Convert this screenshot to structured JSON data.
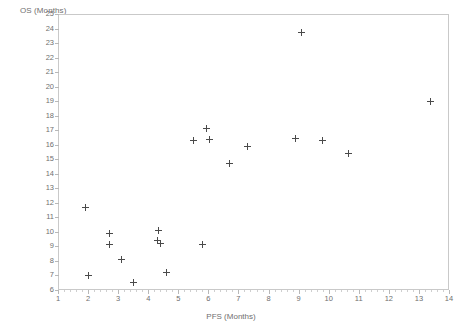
{
  "chart_data": {
    "type": "scatter",
    "title": "",
    "xlabel": "PFS (Months)",
    "ylabel": "OS (Months)",
    "xlim": [
      1,
      14
    ],
    "ylim": [
      6,
      25
    ],
    "xticks": [
      1,
      2,
      3,
      4,
      5,
      6,
      7,
      8,
      9,
      10,
      11,
      12,
      13,
      14
    ],
    "yticks": [
      6,
      7,
      8,
      9,
      10,
      11,
      12,
      13,
      14,
      15,
      16,
      17,
      18,
      19,
      20,
      21,
      22,
      23,
      24,
      25
    ],
    "grid": false,
    "legend": null,
    "marker": "plus",
    "marker_color": "#4a4a4a",
    "points": [
      {
        "x": 1.9,
        "y": 11.7
      },
      {
        "x": 2.0,
        "y": 7.0
      },
      {
        "x": 2.7,
        "y": 9.9
      },
      {
        "x": 2.7,
        "y": 9.1
      },
      {
        "x": 3.1,
        "y": 8.1
      },
      {
        "x": 3.5,
        "y": 6.5
      },
      {
        "x": 4.35,
        "y": 10.1
      },
      {
        "x": 4.3,
        "y": 9.4
      },
      {
        "x": 4.4,
        "y": 9.2
      },
      {
        "x": 4.6,
        "y": 7.2
      },
      {
        "x": 5.5,
        "y": 16.3
      },
      {
        "x": 5.8,
        "y": 9.1
      },
      {
        "x": 5.95,
        "y": 17.1
      },
      {
        "x": 6.05,
        "y": 16.35
      },
      {
        "x": 6.7,
        "y": 14.7
      },
      {
        "x": 7.3,
        "y": 15.85
      },
      {
        "x": 8.9,
        "y": 16.4
      },
      {
        "x": 9.1,
        "y": 23.7
      },
      {
        "x": 9.8,
        "y": 16.3
      },
      {
        "x": 10.65,
        "y": 15.4
      },
      {
        "x": 13.4,
        "y": 19.0
      }
    ]
  },
  "axes": {
    "y_axis_title": "OS (Months)",
    "x_axis_title": "PFS (Months)"
  }
}
